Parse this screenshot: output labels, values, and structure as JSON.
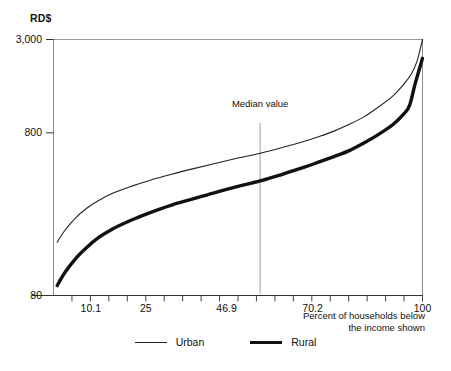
{
  "chart_data": {
    "type": "line",
    "title": "",
    "subtitle": "",
    "ylabel": "RD$",
    "xlabel": "Percent of households below the income shown",
    "xlabel_line1": "Percent of households below",
    "xlabel_line2": "the income shown",
    "grid": false,
    "legend_position": "bottom-center",
    "yticks": [
      "3,000",
      "800",
      "80"
    ],
    "ytick_values": [
      3000,
      800,
      80
    ],
    "yscale": "log",
    "ylim": [
      80,
      3000
    ],
    "xticks": [
      "10.1",
      "25",
      "46.9",
      "70.2",
      "100"
    ],
    "xtick_values": [
      10.1,
      25,
      46.9,
      70.2,
      100
    ],
    "xlim": [
      0,
      100
    ],
    "annotations": [
      {
        "name": "median-value",
        "label": "Median value",
        "x": 56.0,
        "type": "vertical-line"
      }
    ],
    "series": [
      {
        "name": "Urban",
        "style": "thin",
        "color": "#222222",
        "width": 1.1,
        "points": [
          [
            1.0,
            170
          ],
          [
            3.0,
            200
          ],
          [
            6.0,
            240
          ],
          [
            9.0,
            275
          ],
          [
            12.0,
            305
          ],
          [
            16.0,
            340
          ],
          [
            21.0,
            375
          ],
          [
            26.0,
            408
          ],
          [
            32.0,
            445
          ],
          [
            38.0,
            482
          ],
          [
            44.0,
            520
          ],
          [
            50.0,
            560
          ],
          [
            56.0,
            600
          ],
          [
            62.0,
            650
          ],
          [
            68.0,
            710
          ],
          [
            72.0,
            760
          ],
          [
            76.0,
            820
          ],
          [
            80.0,
            900
          ],
          [
            84.0,
            1000
          ],
          [
            88.0,
            1150
          ],
          [
            92.0,
            1350
          ],
          [
            95.0,
            1600
          ],
          [
            97.0,
            1850
          ],
          [
            98.5,
            2200
          ],
          [
            100.0,
            3000
          ]
        ]
      },
      {
        "name": "Rural",
        "style": "thick",
        "color": "#111111",
        "width": 3.4,
        "points": [
          [
            1.0,
            92
          ],
          [
            3.0,
            110
          ],
          [
            6.0,
            135
          ],
          [
            9.0,
            158
          ],
          [
            12.0,
            180
          ],
          [
            16.0,
            205
          ],
          [
            21.0,
            232
          ],
          [
            26.0,
            258
          ],
          [
            32.0,
            288
          ],
          [
            38.0,
            315
          ],
          [
            44.0,
            345
          ],
          [
            50.0,
            375
          ],
          [
            56.0,
            405
          ],
          [
            62.0,
            445
          ],
          [
            68.0,
            492
          ],
          [
            72.0,
            530
          ],
          [
            76.0,
            572
          ],
          [
            80.0,
            620
          ],
          [
            84.0,
            690
          ],
          [
            88.0,
            780
          ],
          [
            92.0,
            900
          ],
          [
            95.0,
            1050
          ],
          [
            96.5,
            1180
          ],
          [
            98.0,
            1600
          ],
          [
            100.0,
            2300
          ]
        ]
      }
    ]
  },
  "legend": {
    "items": [
      {
        "label": "Urban",
        "style": "thin"
      },
      {
        "label": "Rural",
        "style": "thick"
      }
    ]
  }
}
